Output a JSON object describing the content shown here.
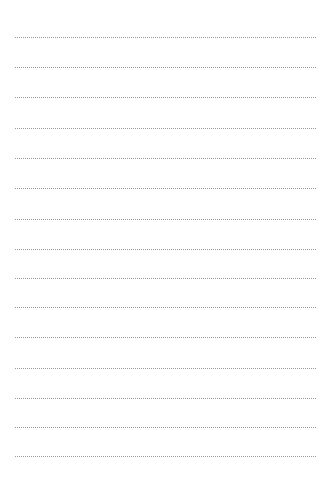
{
  "page": {
    "type": "lined-paper",
    "background_color": "#ffffff",
    "line_color": "#9a9a9a",
    "line_style": "dotted",
    "line_left": 15,
    "line_right": 316,
    "lines": [
      {
        "y": 37
      },
      {
        "y": 67
      },
      {
        "y": 97
      },
      {
        "y": 128
      },
      {
        "y": 158
      },
      {
        "y": 188
      },
      {
        "y": 219
      },
      {
        "y": 249
      },
      {
        "y": 278
      },
      {
        "y": 307
      },
      {
        "y": 337
      },
      {
        "y": 368
      },
      {
        "y": 398
      },
      {
        "y": 427
      },
      {
        "y": 456
      }
    ]
  }
}
